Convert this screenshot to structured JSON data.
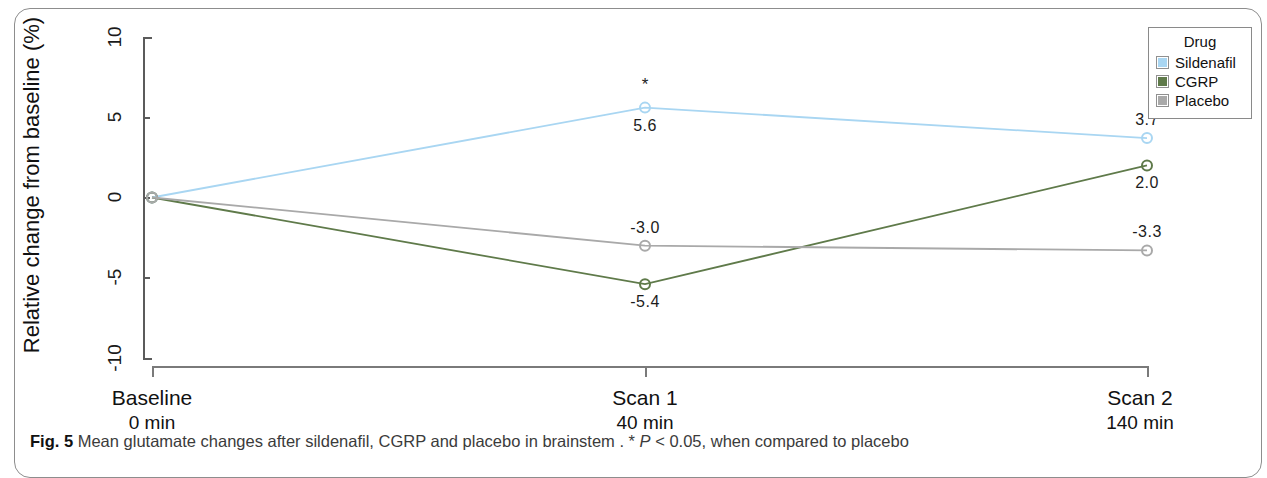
{
  "figure": {
    "caption_prefix": "Fig. 5",
    "caption_text": " Mean glutamate changes after sildenafil, CGRP and placebo in brainstem . * ",
    "caption_italic": "P",
    "caption_tail": " < 0.05, when compared to placebo"
  },
  "legend": {
    "title": "Drug",
    "items": [
      {
        "label": "Sildenafil",
        "color": "#a9d6f2"
      },
      {
        "label": "CGRP",
        "color": "#5f7a4a"
      },
      {
        "label": "Placebo",
        "color": "#a9a9a9"
      }
    ]
  },
  "axes": {
    "y_title": "Relative change from  baseline (%)",
    "y_ticks": [
      "10",
      "5",
      "0",
      "-5",
      "-10"
    ],
    "x_categories": [
      {
        "name": "Baseline",
        "time": "0 min"
      },
      {
        "name": "Scan 1",
        "time": "40 min"
      },
      {
        "name": "Scan 2",
        "time": "140 min"
      }
    ]
  },
  "chart_data": {
    "type": "line",
    "title": "Mean glutamate changes after sildenafil, CGRP and placebo in brainstem",
    "xlabel": "",
    "ylabel": "Relative change from baseline (%)",
    "categories": [
      "Baseline",
      "Scan 1",
      "Scan 2"
    ],
    "category_times": [
      "0 min",
      "40 min",
      "140 min"
    ],
    "ylim": [
      -10,
      10
    ],
    "yticks": [
      -10,
      -5,
      0,
      5,
      10
    ],
    "grid": false,
    "legend_position": "top-right",
    "legend_title": "Drug",
    "series": [
      {
        "name": "Sildenafil",
        "color": "#a9d6f2",
        "values": [
          0,
          5.6,
          3.7
        ],
        "labels": [
          "",
          "5.6",
          "3.7"
        ],
        "significance": [
          "",
          "*",
          ""
        ]
      },
      {
        "name": "CGRP",
        "color": "#5f7a4a",
        "values": [
          0,
          -5.4,
          2.0
        ],
        "labels": [
          "",
          "-5.4",
          "2.0"
        ],
        "significance": [
          "",
          "",
          ""
        ]
      },
      {
        "name": "Placebo",
        "color": "#a9a9a9",
        "values": [
          0,
          -3.0,
          -3.3
        ],
        "labels": [
          "",
          "-3.0",
          "-3.3"
        ],
        "significance": [
          "",
          "",
          ""
        ]
      }
    ],
    "annotations": [
      {
        "text": "*",
        "series": "Sildenafil",
        "category": "Scan 1",
        "meaning": "P < 0.05, when compared to placebo"
      }
    ]
  }
}
